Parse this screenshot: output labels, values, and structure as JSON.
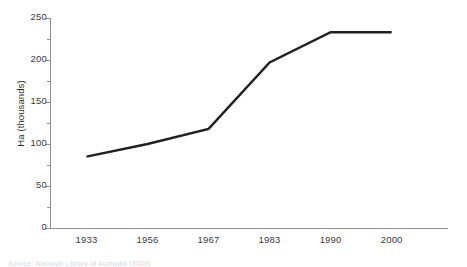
{
  "chart_data": {
    "type": "line",
    "title": "",
    "xlabel": "",
    "ylabel": "Ha (thousands)",
    "categories": [
      "1933",
      "1956",
      "1967",
      "1983",
      "1990",
      "2000"
    ],
    "values": [
      85,
      100,
      118,
      197,
      233,
      233
    ],
    "series": [
      {
        "name": "Ha (thousands)",
        "values": [
          85,
          100,
          118,
          197,
          233,
          233
        ],
        "color": "#231f20"
      }
    ],
    "ylim": [
      0,
      250
    ],
    "ytick_labels": [
      "0",
      "50",
      "100",
      "150",
      "200",
      "250"
    ],
    "ytick_values": [
      0,
      50,
      100,
      150,
      200,
      250
    ],
    "yminor_values": [
      25,
      75,
      125,
      175,
      225
    ],
    "grid": false,
    "legend": "none",
    "axis_color": "#8f8f8f",
    "line_color": "#231f20"
  },
  "caption": {
    "text": "Source: National Library of Australia (2000)"
  }
}
